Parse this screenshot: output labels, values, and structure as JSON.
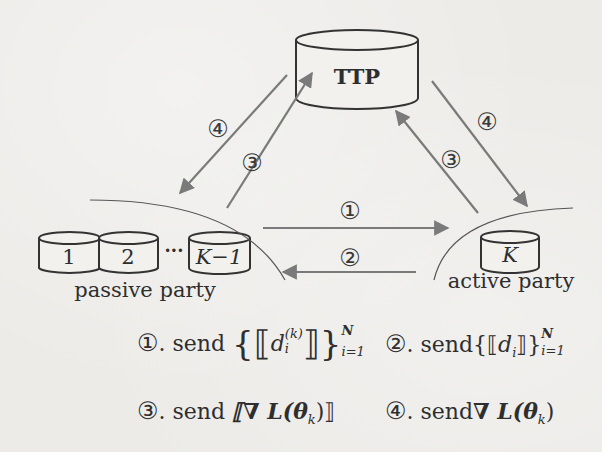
{
  "diagram": {
    "nodes": {
      "ttp": {
        "label": "TTP"
      },
      "passive": {
        "cylinders": [
          "1",
          "2",
          "K−1"
        ],
        "ellipsis": "···",
        "group_label": "passive party"
      },
      "active": {
        "cylinder": "K",
        "group_label": "active party"
      }
    },
    "arrows": [
      {
        "step": "①",
        "from": "passive party",
        "to": "active party",
        "color": "#7a7a7a"
      },
      {
        "step": "②",
        "from": "active party",
        "to": "passive party",
        "color": "#7a7a7a"
      },
      {
        "step": "③",
        "from": "passive party",
        "to": "TTP",
        "color": "#7a7a7a"
      },
      {
        "step": "④",
        "from": "TTP",
        "to": "passive party",
        "color": "#7a7a7a"
      },
      {
        "step": "③",
        "from": "active party",
        "to": "TTP",
        "color": "#7a7a7a"
      },
      {
        "step": "④",
        "from": "TTP",
        "to": "active party",
        "color": "#7a7a7a"
      }
    ],
    "legend": [
      {
        "num": "①",
        "dot": ". ",
        "verb": "send",
        "expr_open": "{⟦",
        "var": "d",
        "var_sub": "i",
        "var_sup": "(k)",
        "expr_close": "⟧}",
        "lim_top": "N",
        "lim_bot": "i=1"
      },
      {
        "num": "②",
        "dot": ". ",
        "verb": "send",
        "expr_open": "{⟦",
        "var": "d",
        "var_sub": "i",
        "expr_close": "⟧}",
        "lim_top": "N",
        "lim_bot": "i=1"
      },
      {
        "num": "③",
        "dot": ". ",
        "verb": "send",
        "expr": "⟦∇ L(θ",
        "expr_sub": "k",
        "expr_close": ")⟧"
      },
      {
        "num": "④",
        "dot": ". ",
        "verb": "send",
        "expr": "∇ L(θ",
        "expr_sub": "k",
        "expr_close": ")"
      }
    ],
    "colors": {
      "background": "#ecebe8",
      "stroke": "#333333",
      "arrow": "#7a7a7a",
      "text": "#2e2e2e"
    }
  }
}
